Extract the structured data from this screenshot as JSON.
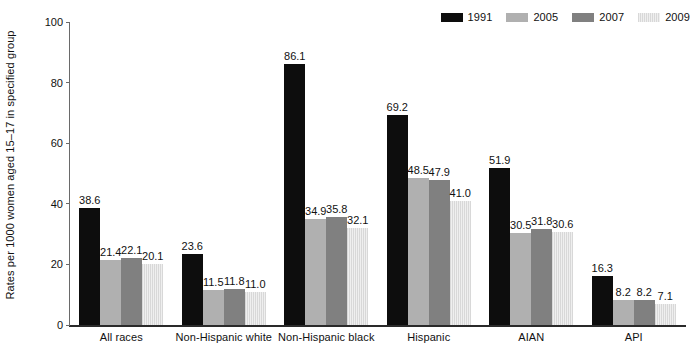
{
  "chart_data": {
    "type": "bar",
    "title": "",
    "xlabel": "",
    "ylabel": "Rates per 1000 women aged 15–17 in specified group",
    "ylim": [
      0,
      100
    ],
    "yticks": [
      0,
      20,
      40,
      60,
      80,
      100
    ],
    "grid": false,
    "legend_position": "top-right",
    "categories": [
      "All races",
      "Non-Hispanic white",
      "Non-Hispanic black",
      "Hispanic",
      "AIAN",
      "API"
    ],
    "series": [
      {
        "name": "1991",
        "color": "#0d0d0d",
        "values": [
          38.6,
          23.6,
          86.1,
          69.2,
          51.9,
          16.3
        ],
        "labels": [
          "38.6",
          "23.6",
          "86.1",
          "69.2",
          "51.9",
          "16.3"
        ]
      },
      {
        "name": "2005",
        "color": "#b0b0b0",
        "values": [
          21.4,
          11.5,
          34.9,
          48.5,
          30.5,
          8.2
        ],
        "labels": [
          "21.4",
          "11.5",
          "34.9",
          "48.5",
          "30.5",
          "8.2"
        ]
      },
      {
        "name": "2007",
        "color": "#808080",
        "values": [
          22.1,
          11.8,
          35.8,
          47.9,
          31.8,
          8.2
        ],
        "labels": [
          "22.1",
          "11.8",
          "35.8",
          "47.9",
          "31.8",
          "8.2"
        ]
      },
      {
        "name": "2009",
        "color": "#e2e2e2",
        "values": [
          20.1,
          11.0,
          32.1,
          41.0,
          30.6,
          7.1
        ],
        "labels": [
          "20.1",
          "11.0",
          "32.1",
          "41.0",
          "30.6",
          "7.1"
        ]
      }
    ]
  },
  "axis": {
    "y_title": "Rates per 1000 women aged 15–17 in specified group",
    "y_ticks": [
      "100",
      "80",
      "60",
      "40",
      "20",
      "0"
    ]
  },
  "legend": {
    "items": [
      {
        "label": "1991"
      },
      {
        "label": "2005"
      },
      {
        "label": "2007"
      },
      {
        "label": "2009"
      }
    ]
  }
}
